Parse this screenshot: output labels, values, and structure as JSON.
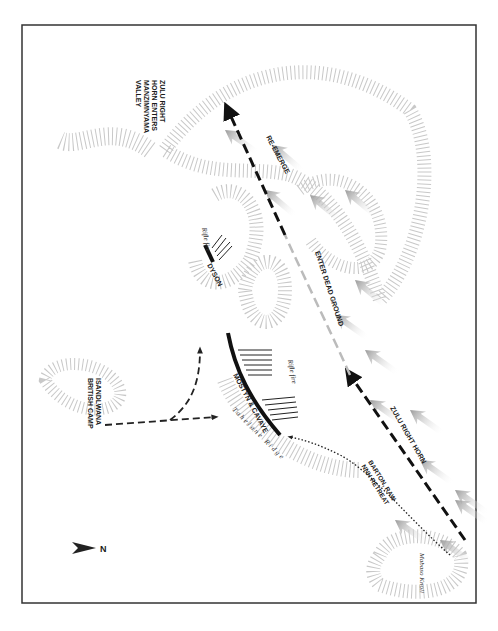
{
  "map": {
    "title": "Isandlwana – Zulu right horn movement",
    "labels": {
      "zulu_right_horn_valley": [
        "ZULU RIGHT",
        "HORN ENTERS",
        "MANZIMNYAMA",
        "VALLEY"
      ],
      "re_emerge": "RE-EMERGE",
      "enter_dead_ground": "ENTER DEAD GROUND",
      "zulu_right_horn": "ZULU RIGHT HORN",
      "barton_retreat": [
        "BARTON, RAW",
        "NNH RETREAT"
      ],
      "dyson": "DYSON",
      "rifle_fire_1": "Rifle fire",
      "rifle_fire_2": "Rifle fire",
      "mostyn_cavaye": "MOSTYN & CAVAYE",
      "tahelane_ridge": "Tahelane Ridge",
      "british_camp": [
        "ISANDLWANA",
        "BRITISH CAMP"
      ],
      "mabaso_knoll": "Mabaso Knoll",
      "north": "N"
    },
    "colors": {
      "frame": "#333333",
      "hachure": "#c8c8c8",
      "zulu_arrow": "#a0a0a0",
      "line": "#111111"
    }
  }
}
